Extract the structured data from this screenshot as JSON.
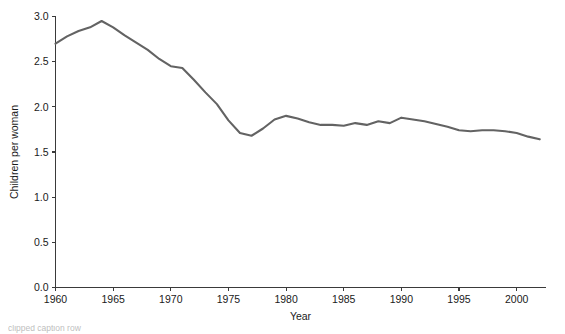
{
  "figure": {
    "background_color": "#ffffff",
    "line_color": "#636363",
    "axis_color": "#3a3a3a",
    "text_color": "#1a1a1a"
  },
  "caption": {
    "text": "clipped caption row"
  },
  "chart_data": {
    "type": "line",
    "title": "",
    "xlabel": "Year",
    "ylabel": "Children per woman",
    "xlim": [
      1960,
      2002.5
    ],
    "ylim": [
      0.0,
      3.0
    ],
    "grid": false,
    "legend": "none",
    "line_color": "#636363",
    "markers": "none",
    "x_ticks": [
      1960,
      1965,
      1970,
      1975,
      1980,
      1985,
      1990,
      1995,
      2000
    ],
    "x_tick_labels": [
      "1960",
      "1965",
      "1970",
      "1975",
      "1980",
      "1985",
      "1990",
      "1995",
      "2000"
    ],
    "y_ticks": [
      0.0,
      0.5,
      1.0,
      1.5,
      2.0,
      2.5,
      3.0
    ],
    "y_tick_labels": [
      "0.0",
      "0.5",
      "1.0",
      "1.5",
      "2.0",
      "2.5",
      "3.0"
    ],
    "series": [
      {
        "name": "Children per woman",
        "x": [
          1960,
          1961,
          1962,
          1963,
          1964,
          1965,
          1966,
          1967,
          1968,
          1969,
          1970,
          1971,
          1972,
          1973,
          1974,
          1975,
          1976,
          1977,
          1978,
          1979,
          1980,
          1981,
          1982,
          1983,
          1984,
          1985,
          1986,
          1987,
          1988,
          1989,
          1990,
          1991,
          1992,
          1993,
          1994,
          1995,
          1996,
          1997,
          1998,
          1999,
          2000,
          2001,
          2002
        ],
        "values": [
          2.7,
          2.78,
          2.84,
          2.88,
          2.95,
          2.88,
          2.79,
          2.71,
          2.63,
          2.53,
          2.45,
          2.43,
          2.3,
          2.16,
          2.03,
          1.85,
          1.71,
          1.68,
          1.76,
          1.86,
          1.9,
          1.87,
          1.83,
          1.8,
          1.8,
          1.79,
          1.82,
          1.8,
          1.84,
          1.82,
          1.88,
          1.86,
          1.84,
          1.81,
          1.78,
          1.74,
          1.73,
          1.74,
          1.74,
          1.73,
          1.71,
          1.67,
          1.64
        ]
      }
    ]
  }
}
